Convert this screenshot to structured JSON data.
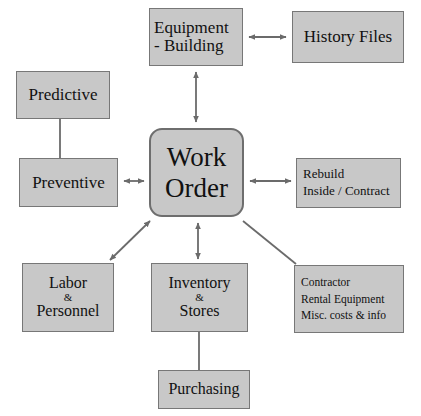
{
  "diagram": {
    "canvas": {
      "width": 421,
      "height": 416
    },
    "style": {
      "node_fill": "#c8c8c8",
      "node_border": "#777777",
      "edge_color": "#6b6b6b",
      "text_color": "#111111",
      "background": "#ffffff"
    },
    "nodes": {
      "equipment_building": {
        "line1": "Equipment",
        "line2": "- Building"
      },
      "history_files": {
        "line1": "History Files"
      },
      "predictive": {
        "line1": "Predictive"
      },
      "preventive": {
        "line1": "Preventive"
      },
      "work_order": {
        "line1": "Work",
        "line2": "Order"
      },
      "rebuild": {
        "line1": "Rebuild",
        "line2": "Inside / Contract"
      },
      "labor": {
        "line1": "Labor",
        "line2": "&",
        "line3": "Personnel"
      },
      "inventory": {
        "line1": "Inventory",
        "line2": "&",
        "line3": "Stores"
      },
      "contractor": {
        "line1": "Contractor",
        "line2": "Rental Equipment",
        "line3": "Misc. costs & info"
      },
      "purchasing": {
        "line1": "Purchasing"
      }
    },
    "edges": [
      {
        "id": "equipment-to-history",
        "from": "equipment_building",
        "to": "history_files",
        "arrows": "both",
        "orientation": "horizontal"
      },
      {
        "id": "workorder-to-equipment",
        "from": "work_order",
        "to": "equipment_building",
        "arrows": "both",
        "orientation": "vertical"
      },
      {
        "id": "predictive-to-preventive",
        "from": "predictive",
        "to": "preventive",
        "arrows": "none",
        "orientation": "vertical"
      },
      {
        "id": "preventive-to-workorder",
        "from": "preventive",
        "to": "work_order",
        "arrows": "both",
        "orientation": "horizontal"
      },
      {
        "id": "workorder-to-rebuild",
        "from": "work_order",
        "to": "rebuild",
        "arrows": "both",
        "orientation": "horizontal"
      },
      {
        "id": "labor-to-workorder",
        "from": "labor",
        "to": "work_order",
        "arrows": "both",
        "orientation": "diagonal"
      },
      {
        "id": "inventory-to-workorder",
        "from": "inventory",
        "to": "work_order",
        "arrows": "both",
        "orientation": "vertical"
      },
      {
        "id": "contractor-to-workorder",
        "from": "contractor",
        "to": "work_order",
        "arrows": "none",
        "orientation": "diagonal"
      },
      {
        "id": "inventory-to-purchasing",
        "from": "inventory",
        "to": "purchasing",
        "arrows": "none",
        "orientation": "vertical"
      }
    ]
  }
}
